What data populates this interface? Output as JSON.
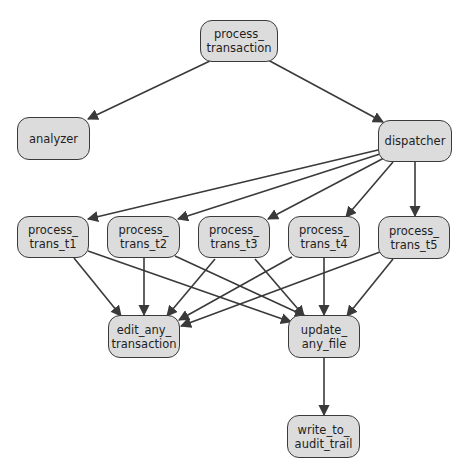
{
  "diagram": {
    "type": "call-graph",
    "colors": {
      "node_fill": "#dcdcdc",
      "node_border": "#3a3a3a",
      "edge": "#3a3a3a"
    },
    "nodes": [
      {
        "id": "process_transaction",
        "label": "process_\ntransaction",
        "x": 200,
        "y": 20,
        "w": 78,
        "h": 42
      },
      {
        "id": "analyzer",
        "label": "analyzer",
        "x": 17,
        "y": 117,
        "w": 73,
        "h": 43
      },
      {
        "id": "dispatcher",
        "label": "dispatcher",
        "x": 378,
        "y": 120,
        "w": 74,
        "h": 42
      },
      {
        "id": "process_trans_t1",
        "label": "process_\ntrans_t1",
        "x": 17,
        "y": 216,
        "w": 72,
        "h": 42
      },
      {
        "id": "process_trans_t2",
        "label": "process_\ntrans_t2",
        "x": 107,
        "y": 216,
        "w": 73,
        "h": 42
      },
      {
        "id": "process_trans_t3",
        "label": "process_\ntrans_t3",
        "x": 198,
        "y": 216,
        "w": 72,
        "h": 42
      },
      {
        "id": "process_trans_t4",
        "label": "process_\ntrans_t4",
        "x": 288,
        "y": 216,
        "w": 72,
        "h": 42
      },
      {
        "id": "process_trans_t5",
        "label": "process_\ntrans_t5",
        "x": 378,
        "y": 216,
        "w": 72,
        "h": 43
      },
      {
        "id": "edit_any_transaction",
        "label": "edit_any_\ntransaction",
        "x": 108,
        "y": 315,
        "w": 72,
        "h": 43
      },
      {
        "id": "update_any_file",
        "label": "update_\nany_file",
        "x": 288,
        "y": 315,
        "w": 72,
        "h": 43
      },
      {
        "id": "write_to_audit_trail",
        "label": "write_to_\naudit_trail",
        "x": 287,
        "y": 415,
        "w": 73,
        "h": 43
      }
    ],
    "edges": [
      {
        "from": "process_transaction",
        "to": "analyzer",
        "x1": 212,
        "y1": 60,
        "x2": 88,
        "y2": 119
      },
      {
        "from": "process_transaction",
        "to": "dispatcher",
        "x1": 268,
        "y1": 60,
        "x2": 383,
        "y2": 122
      },
      {
        "from": "dispatcher",
        "to": "process_trans_t1",
        "x1": 378,
        "y1": 150,
        "x2": 88,
        "y2": 219
      },
      {
        "from": "dispatcher",
        "to": "process_trans_t2",
        "x1": 380,
        "y1": 154,
        "x2": 178,
        "y2": 219
      },
      {
        "from": "dispatcher",
        "to": "process_trans_t3",
        "x1": 384,
        "y1": 158,
        "x2": 268,
        "y2": 219
      },
      {
        "from": "dispatcher",
        "to": "process_trans_t4",
        "x1": 393,
        "y1": 162,
        "x2": 346,
        "y2": 217
      },
      {
        "from": "dispatcher",
        "to": "process_trans_t5",
        "x1": 415,
        "y1": 162,
        "x2": 415,
        "y2": 216
      },
      {
        "from": "process_trans_t1",
        "to": "edit_any_transaction",
        "x1": 74,
        "y1": 258,
        "x2": 121,
        "y2": 316
      },
      {
        "from": "process_trans_t1",
        "to": "update_any_file",
        "x1": 88,
        "y1": 251,
        "x2": 291,
        "y2": 322
      },
      {
        "from": "process_trans_t2",
        "to": "edit_any_transaction",
        "x1": 144,
        "y1": 258,
        "x2": 144,
        "y2": 315
      },
      {
        "from": "process_trans_t2",
        "to": "update_any_file",
        "x1": 175,
        "y1": 256,
        "x2": 305,
        "y2": 316
      },
      {
        "from": "process_trans_t3",
        "to": "edit_any_transaction",
        "x1": 215,
        "y1": 259,
        "x2": 167,
        "y2": 316
      },
      {
        "from": "process_trans_t3",
        "to": "update_any_file",
        "x1": 255,
        "y1": 259,
        "x2": 304,
        "y2": 316
      },
      {
        "from": "process_trans_t4",
        "to": "edit_any_transaction",
        "x1": 292,
        "y1": 257,
        "x2": 179,
        "y2": 320
      },
      {
        "from": "process_trans_t4",
        "to": "update_any_file",
        "x1": 324,
        "y1": 258,
        "x2": 324,
        "y2": 315
      },
      {
        "from": "process_trans_t5",
        "to": "edit_any_transaction",
        "x1": 380,
        "y1": 252,
        "x2": 181,
        "y2": 326
      },
      {
        "from": "process_trans_t5",
        "to": "update_any_file",
        "x1": 393,
        "y1": 259,
        "x2": 347,
        "y2": 316
      },
      {
        "from": "update_any_file",
        "to": "write_to_audit_trail",
        "x1": 324,
        "y1": 358,
        "x2": 324,
        "y2": 415
      }
    ]
  }
}
